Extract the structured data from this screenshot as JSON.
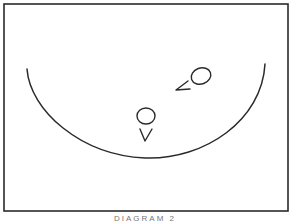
{
  "diagram": {
    "caption": "DIAGRAM 2",
    "stroke_color": "#2a2a2a",
    "background": "#ffffff",
    "frame": {
      "x": 4,
      "y": 4,
      "width": 284,
      "height": 208
    },
    "arc": {
      "start": [
        27,
        69
      ],
      "bottom": [
        145,
        158
      ],
      "end": [
        265,
        64
      ]
    },
    "players": [
      {
        "id": "player-upper",
        "cx": 201,
        "cy": 76,
        "r": 9,
        "marker": "<",
        "marker_at": [
          183,
          88
        ]
      },
      {
        "id": "player-lower",
        "cx": 146,
        "cy": 116,
        "r": 8,
        "marker": "V",
        "marker_at": [
          146,
          132
        ]
      }
    ]
  }
}
